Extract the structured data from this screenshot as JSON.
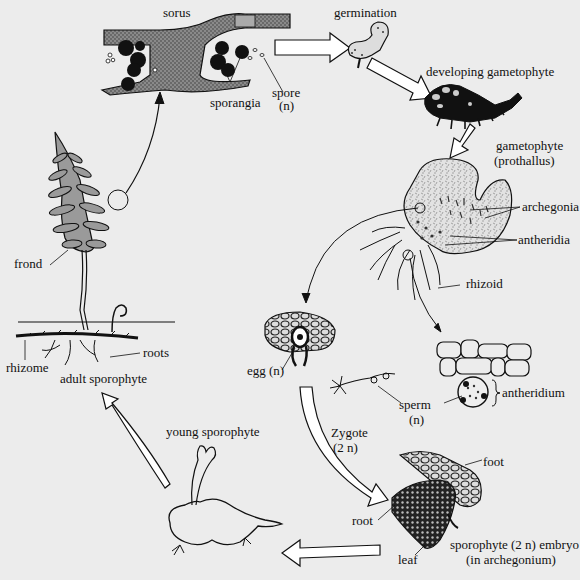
{
  "diagram": {
    "colors": {
      "background": "#ececec",
      "ink": "#111111",
      "tissue_gray": "#7a7a7a",
      "frond_gray": "#9a9a9a",
      "prothallus_fill": "#dcdcdc"
    },
    "labels": {
      "sorus": "sorus",
      "sporangia": "sporangia",
      "spore": "spore",
      "spore_ploidy": "(n)",
      "germination": "germination",
      "developing_gametophyte": "developing gametophyte",
      "gametophyte": "gametophyte",
      "prothallus": "(prothallus)",
      "archegonia": "archegonia",
      "antheridia": "antheridia",
      "rhizoid": "rhizoid",
      "egg": "egg (n)",
      "antheridium": "antheridium",
      "sperm": "sperm",
      "sperm_ploidy": "(n)",
      "zygote": "Zygote",
      "zygote_ploidy": "(2 n)",
      "foot": "foot",
      "root_embryo": "root",
      "leaf": "leaf",
      "embryo": "sporophyte (2 n) embryo",
      "embryo_location": "(in archegonium)",
      "young_sporophyte": "young sporophyte",
      "adult_sporophyte": "adult sporophyte",
      "frond": "frond",
      "rhizome": "rhizome",
      "roots": "roots"
    },
    "stages": [
      "sorus",
      "spore (n)",
      "germination",
      "developing gametophyte",
      "gametophyte (prothallus)",
      "egg (n) / sperm (n)",
      "Zygote (2 n)",
      "sporophyte (2 n) embryo (in archegonium)",
      "young sporophyte",
      "adult sporophyte"
    ]
  }
}
